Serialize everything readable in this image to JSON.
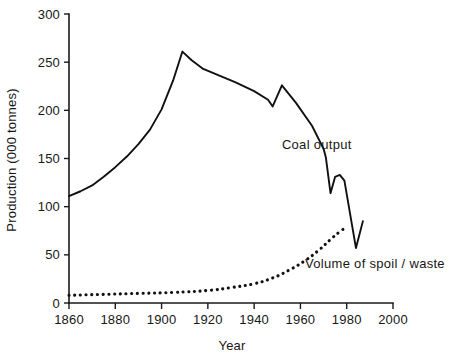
{
  "chart_data": {
    "type": "line",
    "title": "",
    "xlabel": "Year",
    "ylabel": "Production (000 tonnes)",
    "xlim": [
      1860,
      2000
    ],
    "ylim": [
      0,
      300
    ],
    "grid": false,
    "legend_position": "inline-annotations",
    "xticks": [
      1860,
      1880,
      1900,
      1920,
      1940,
      1960,
      1980,
      2000
    ],
    "xtick_labels": [
      "1860",
      "1880",
      "1900",
      "1920",
      "1940",
      "1960",
      "1980",
      "2000"
    ],
    "yticks": [
      0,
      50,
      100,
      150,
      200,
      250,
      300
    ],
    "ytick_labels": [
      "0",
      "50",
      "100",
      "150",
      "200",
      "250",
      "300"
    ],
    "series": [
      {
        "name": "Coal output",
        "style": "solid",
        "annotation": "Coal output",
        "annotation_at": [
          1952,
          160
        ],
        "points": [
          [
            1860,
            111
          ],
          [
            1865,
            116
          ],
          [
            1870,
            122
          ],
          [
            1875,
            131
          ],
          [
            1880,
            141
          ],
          [
            1885,
            152
          ],
          [
            1890,
            165
          ],
          [
            1895,
            180
          ],
          [
            1900,
            201
          ],
          [
            1905,
            231
          ],
          [
            1909,
            261
          ],
          [
            1913,
            252
          ],
          [
            1918,
            243
          ],
          [
            1925,
            236
          ],
          [
            1932,
            229
          ],
          [
            1940,
            220
          ],
          [
            1946,
            211
          ],
          [
            1948,
            204
          ],
          [
            1952,
            226
          ],
          [
            1958,
            208
          ],
          [
            1965,
            184
          ],
          [
            1970,
            160
          ],
          [
            1971,
            151
          ],
          [
            1973,
            114
          ],
          [
            1975,
            131
          ],
          [
            1977,
            133
          ],
          [
            1979,
            127
          ],
          [
            1984,
            57
          ],
          [
            1987,
            85
          ]
        ]
      },
      {
        "name": "Volume of spoil/waste",
        "style": "dotted",
        "annotation": "Volume of spoil / waste",
        "annotation_at": [
          1962,
          36
        ],
        "points": [
          [
            1860,
            8
          ],
          [
            1875,
            9
          ],
          [
            1890,
            10
          ],
          [
            1905,
            11
          ],
          [
            1920,
            13
          ],
          [
            1930,
            16
          ],
          [
            1940,
            20
          ],
          [
            1948,
            26
          ],
          [
            1955,
            34
          ],
          [
            1962,
            44
          ],
          [
            1968,
            55
          ],
          [
            1973,
            66
          ],
          [
            1977,
            74
          ],
          [
            1980,
            79
          ]
        ]
      }
    ]
  },
  "annotations": {
    "coal_output_label": "Coal output",
    "spoil_waste_label": "Volume of spoil / waste"
  },
  "axes": {
    "x_title": "Year",
    "y_title": "Production (000 tonnes)"
  }
}
